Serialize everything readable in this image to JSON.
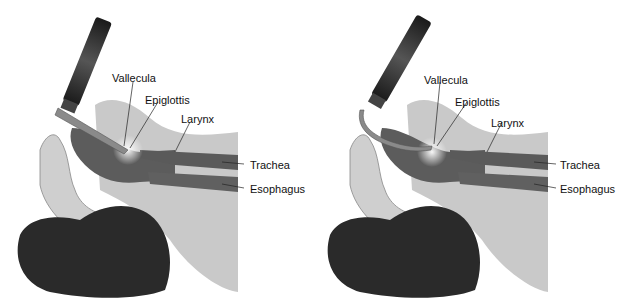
{
  "figures": [
    {
      "id": "straight-blade",
      "blade_type": "straight",
      "labels": {
        "vallecula": "Vallecula",
        "epiglottis": "Epiglottis",
        "larynx": "Larynx",
        "trachea": "Trachea",
        "esophagus": "Esophagus"
      }
    },
    {
      "id": "curved-blade",
      "blade_type": "curved",
      "labels": {
        "vallecula": "Vallecula",
        "epiglottis": "Epiglottis",
        "larynx": "Larynx",
        "trachea": "Trachea",
        "esophagus": "Esophagus"
      }
    }
  ],
  "colors": {
    "skin": "#c8c8c8",
    "skin_dark": "#a8a8a8",
    "airway": "#5a5a5a",
    "hair": "#2a2a2a",
    "handle": "#333333",
    "blade": "#888888",
    "label": "#111111"
  }
}
